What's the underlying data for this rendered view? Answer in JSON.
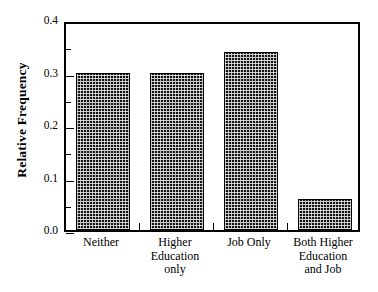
{
  "chart_data": {
    "type": "bar",
    "title": "",
    "xlabel": "",
    "ylabel": "Relative Frequency",
    "categories": [
      "Neither",
      "Higher Education only",
      "Job Only",
      "Both Higher Education and Job"
    ],
    "category_lines": [
      [
        "Neither"
      ],
      [
        "Higher",
        "Education",
        "only"
      ],
      [
        "Job Only"
      ],
      [
        "Both Higher",
        "Education",
        "and Job"
      ]
    ],
    "values": [
      0.3,
      0.3,
      0.34,
      0.06
    ],
    "ylim": [
      0.0,
      0.4
    ],
    "ytick_labels": [
      "0.0",
      "0.1",
      "0.2",
      "0.3",
      "0.4"
    ],
    "ytick_values": [
      0.0,
      0.1,
      0.2,
      0.3,
      0.4
    ],
    "yminor_values": [
      0.05,
      0.15,
      0.25,
      0.35
    ],
    "grid": false,
    "legend": "none",
    "bar_fill_color": "#141414",
    "bar_edge_color": "#000000",
    "axis_color": "#000000",
    "background_color": "#ffffff"
  }
}
